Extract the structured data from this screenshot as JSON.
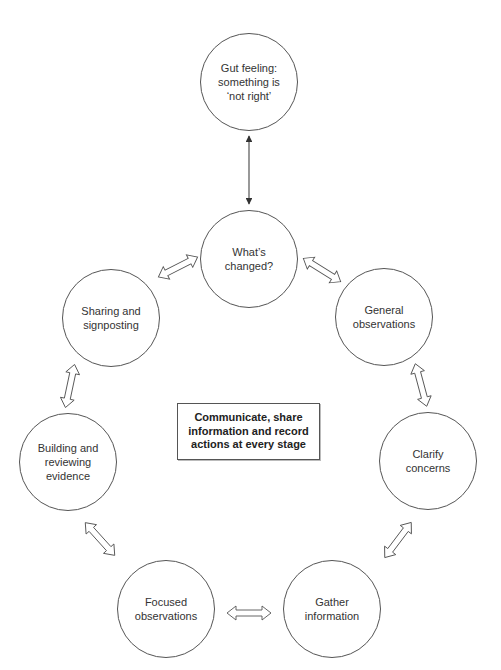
{
  "diagram": {
    "type": "cycle",
    "trigger": {
      "id": "gut-feeling",
      "label": "Gut feeling:\nsomething is\n‘not right’"
    },
    "center_box": {
      "label": "Communicate, share\ninformation and record\nactions at every stage"
    },
    "nodes": [
      {
        "id": "whats-changed",
        "label": "What’s\nchanged?"
      },
      {
        "id": "general-observations",
        "label": "General\nobservations"
      },
      {
        "id": "clarify-concerns",
        "label": "Clarify\nconcerns"
      },
      {
        "id": "gather-information",
        "label": "Gather\ninformation"
      },
      {
        "id": "focused-observations",
        "label": "Focused\nobservations"
      },
      {
        "id": "building-reviewing-evidence",
        "label": "Building and\nreviewing\nevidence"
      },
      {
        "id": "sharing-signposting",
        "label": "Sharing and\nsignposting"
      }
    ],
    "edges": [
      {
        "from": "gut-feeling",
        "to": "whats-changed",
        "style": "thin-double-arrow"
      },
      {
        "from": "whats-changed",
        "to": "general-observations",
        "style": "hollow-double-arrow"
      },
      {
        "from": "general-observations",
        "to": "clarify-concerns",
        "style": "hollow-double-arrow"
      },
      {
        "from": "clarify-concerns",
        "to": "gather-information",
        "style": "hollow-double-arrow"
      },
      {
        "from": "gather-information",
        "to": "focused-observations",
        "style": "hollow-double-arrow"
      },
      {
        "from": "focused-observations",
        "to": "building-reviewing-evidence",
        "style": "hollow-double-arrow"
      },
      {
        "from": "building-reviewing-evidence",
        "to": "sharing-signposting",
        "style": "hollow-double-arrow"
      },
      {
        "from": "sharing-signposting",
        "to": "whats-changed",
        "style": "hollow-double-arrow"
      }
    ],
    "colors": {
      "stroke": "#555555",
      "text": "#333333",
      "background": "#ffffff"
    }
  }
}
